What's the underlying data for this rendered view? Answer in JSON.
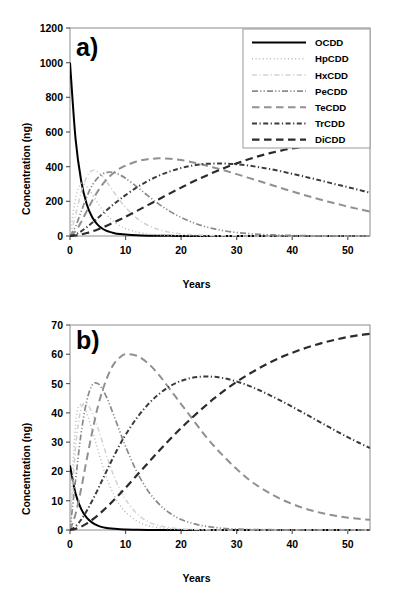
{
  "figure": {
    "panels": [
      {
        "tag": "a)",
        "xlabel": "Years",
        "ylabel": "Concentration (ng)",
        "yticks": [
          "0",
          "200",
          "400",
          "600",
          "800",
          "1000",
          "1200"
        ],
        "xticks": [
          "0",
          "10",
          "20",
          "30",
          "40",
          "50"
        ]
      },
      {
        "tag": "b)",
        "xlabel": "Years",
        "ylabel": "Concentration (ng)",
        "yticks": [
          "0",
          "10",
          "20",
          "30",
          "40",
          "50",
          "60",
          "70"
        ],
        "xticks": [
          "0",
          "10",
          "20",
          "30",
          "40",
          "50"
        ]
      }
    ],
    "legend": {
      "position": "top-right-panel-a",
      "entries": [
        {
          "label": "OCDD",
          "style": "solid",
          "color": "#000000",
          "width": 2.0
        },
        {
          "label": "HpCDD",
          "style": "dotted",
          "color": "#b9b9b9",
          "width": 1.5
        },
        {
          "label": "HxCDD",
          "style": "dash-dot",
          "color": "#d2d2d2",
          "width": 1.5
        },
        {
          "label": "PeCDD",
          "style": "dash-dot-dot",
          "color": "#8a8a8a",
          "width": 1.7
        },
        {
          "label": "TeCDD",
          "style": "long-dash",
          "color": "#909090",
          "width": 2.0
        },
        {
          "label": "TrCDD",
          "style": "dash-dot",
          "color": "#3a3a3a",
          "width": 2.0
        },
        {
          "label": "DiCDD",
          "style": "long-dash",
          "color": "#2b2b2b",
          "width": 2.2
        }
      ]
    }
  },
  "chart_data": [
    {
      "type": "line",
      "panel": "a)",
      "title": "",
      "xlabel": "Years",
      "ylabel": "Concentration (ng)",
      "xlim": [
        0,
        54
      ],
      "ylim": [
        0,
        1200
      ],
      "xticks": [
        0,
        10,
        20,
        30,
        40,
        50
      ],
      "yticks": [
        0,
        200,
        400,
        600,
        800,
        1000,
        1200
      ],
      "grid": false,
      "legend_position": "upper right",
      "x": [
        0,
        1,
        2,
        3,
        4,
        5,
        6,
        7,
        8,
        9,
        10,
        12,
        14,
        16,
        18,
        20,
        22,
        24,
        26,
        28,
        30,
        32,
        34,
        36,
        38,
        40,
        42,
        44,
        46,
        48,
        50,
        52,
        54
      ],
      "series": [
        {
          "name": "OCDD",
          "style": "solid",
          "color": "#000000",
          "peak_x": 0,
          "peak_y": 1000,
          "values": [
            1000,
            560,
            320,
            185,
            108,
            64,
            39,
            25,
            16,
            11,
            8,
            4,
            2,
            1,
            1,
            0,
            0,
            0,
            0,
            0,
            0,
            0,
            0,
            0,
            0,
            0,
            0,
            0,
            0,
            0,
            0,
            0,
            0
          ]
        },
        {
          "name": "HpCDD",
          "style": "dotted",
          "color": "#b9b9b9",
          "peak_x": 2.2,
          "peak_y": 305,
          "values": [
            0,
            215,
            302,
            287,
            240,
            190,
            145,
            108,
            80,
            59,
            43,
            23,
            12,
            6,
            3,
            2,
            1,
            0,
            0,
            0,
            0,
            0,
            0,
            0,
            0,
            0,
            0,
            0,
            0,
            0,
            0,
            0,
            0
          ]
        },
        {
          "name": "HxCDD",
          "style": "dash-dot",
          "color": "#d2d2d2",
          "peak_x": 3.8,
          "peak_y": 380,
          "values": [
            0,
            120,
            250,
            340,
            378,
            370,
            338,
            295,
            248,
            204,
            165,
            103,
            62,
            37,
            21,
            12,
            7,
            4,
            2,
            1,
            1,
            0,
            0,
            0,
            0,
            0,
            0,
            0,
            0,
            0,
            0,
            0,
            0
          ]
        },
        {
          "name": "PeCDD",
          "style": "dash-dot-dot",
          "color": "#8a8a8a",
          "peak_x": 6.5,
          "peak_y": 370,
          "values": [
            0,
            55,
            140,
            225,
            292,
            335,
            360,
            369,
            365,
            352,
            333,
            285,
            233,
            184,
            142,
            107,
            79,
            57,
            41,
            29,
            20,
            14,
            10,
            7,
            5,
            3,
            2,
            1,
            1,
            1,
            0,
            0,
            0
          ]
        },
        {
          "name": "TeCDD",
          "style": "long-dash",
          "color": "#909090",
          "peak_x": 13,
          "peak_y": 448,
          "values": [
            0,
            28,
            80,
            143,
            204,
            258,
            303,
            340,
            368,
            390,
            406,
            430,
            443,
            448,
            446,
            438,
            426,
            411,
            394,
            376,
            357,
            337,
            317,
            297,
            277,
            257,
            238,
            220,
            202,
            186,
            170,
            155,
            141
          ]
        },
        {
          "name": "TrCDD",
          "style": "dash-dot",
          "color": "#3a3a3a",
          "peak_x": 24,
          "peak_y": 418,
          "values": [
            0,
            9,
            27,
            50,
            76,
            104,
            132,
            160,
            187,
            212,
            236,
            280,
            317,
            348,
            373,
            392,
            406,
            415,
            418,
            418,
            414,
            407,
            397,
            386,
            373,
            359,
            344,
            329,
            313,
            297,
            282,
            266,
            250
          ]
        },
        {
          "name": "DiCDD",
          "style": "long-dash",
          "color": "#2b2b2b",
          "peak_x": 54,
          "peak_y": 525,
          "values": [
            0,
            3,
            9,
            17,
            27,
            38,
            51,
            65,
            80,
            95,
            111,
            144,
            178,
            212,
            246,
            279,
            311,
            341,
            369,
            395,
            419,
            441,
            461,
            478,
            493,
            505,
            514,
            519,
            522,
            524,
            525,
            524,
            522
          ]
        }
      ]
    },
    {
      "type": "line",
      "panel": "b)",
      "title": "",
      "xlabel": "Years",
      "ylabel": "Concentration (ng)",
      "xlim": [
        0,
        54
      ],
      "ylim": [
        0,
        70
      ],
      "xticks": [
        0,
        10,
        20,
        30,
        40,
        50
      ],
      "yticks": [
        0,
        10,
        20,
        30,
        40,
        50,
        60,
        70
      ],
      "grid": false,
      "legend_position": "none",
      "x": [
        0,
        1,
        2,
        3,
        4,
        5,
        6,
        7,
        8,
        9,
        10,
        12,
        14,
        16,
        18,
        20,
        22,
        24,
        26,
        28,
        30,
        32,
        34,
        36,
        38,
        40,
        42,
        44,
        46,
        48,
        50,
        52,
        54
      ],
      "series": [
        {
          "name": "OCDD",
          "style": "solid",
          "color": "#000000",
          "peak_x": 0,
          "peak_y": 22,
          "values": [
            22,
            12.5,
            7.2,
            4.2,
            2.5,
            1.5,
            0.9,
            0.6,
            0.4,
            0.25,
            0.18,
            0.08,
            0.04,
            0.02,
            0.01,
            0,
            0,
            0,
            0,
            0,
            0,
            0,
            0,
            0,
            0,
            0,
            0,
            0,
            0,
            0,
            0,
            0,
            0
          ]
        },
        {
          "name": "HpCDD",
          "style": "dotted",
          "color": "#b9b9b9",
          "peak_x": 1.6,
          "peak_y": 43,
          "values": [
            0,
            36,
            43,
            40,
            34,
            27.5,
            21,
            15.8,
            11.6,
            8.4,
            6.1,
            3.1,
            1.5,
            0.8,
            0.4,
            0.2,
            0.1,
            0,
            0,
            0,
            0,
            0,
            0,
            0,
            0,
            0,
            0,
            0,
            0,
            0,
            0,
            0,
            0
          ]
        },
        {
          "name": "HxCDD",
          "style": "dash-dot",
          "color": "#d2d2d2",
          "peak_x": 2.2,
          "peak_y": 43,
          "values": [
            0,
            28,
            41.5,
            43,
            40,
            35,
            29,
            23,
            18,
            13.8,
            10.4,
            5.6,
            2.9,
            1.5,
            0.8,
            0.4,
            0.2,
            0.1,
            0,
            0,
            0,
            0,
            0,
            0,
            0,
            0,
            0,
            0,
            0,
            0,
            0,
            0,
            0
          ]
        },
        {
          "name": "PeCDD",
          "style": "dash-dot-dot",
          "color": "#8a8a8a",
          "peak_x": 3.8,
          "peak_y": 50,
          "values": [
            0,
            17,
            33,
            44,
            49.5,
            50,
            47.5,
            43.5,
            38.5,
            33.5,
            28.5,
            20,
            13.5,
            8.9,
            5.7,
            3.6,
            2.3,
            1.4,
            0.9,
            0.5,
            0.3,
            0.2,
            0.1,
            0.1,
            0,
            0,
            0,
            0,
            0,
            0,
            0,
            0,
            0
          ]
        },
        {
          "name": "TeCDD",
          "style": "long-dash",
          "color": "#909090",
          "peak_x": 10.5,
          "peak_y": 60,
          "values": [
            0,
            5.5,
            14,
            24,
            33.5,
            42,
            48.5,
            53.5,
            57,
            59,
            60,
            59.5,
            57,
            53,
            48,
            43,
            38,
            33,
            28.5,
            24.5,
            20.8,
            17.5,
            14.8,
            12.5,
            10.5,
            8.9,
            7.5,
            6.4,
            5.5,
            4.8,
            4.2,
            3.8,
            3.5
          ]
        },
        {
          "name": "TrCDD",
          "style": "dash-dot",
          "color": "#3a3a3a",
          "peak_x": 23,
          "peak_y": 52.5,
          "values": [
            0,
            1.2,
            3.5,
            6.5,
            10,
            13.8,
            17.8,
            21.8,
            25.6,
            29.2,
            32.5,
            38.2,
            42.8,
            46.4,
            49.1,
            50.9,
            52,
            52.4,
            52.3,
            51.7,
            50.7,
            49.4,
            47.8,
            46,
            44.1,
            42.1,
            40,
            37.9,
            35.8,
            33.7,
            31.7,
            29.8,
            28
          ]
        },
        {
          "name": "DiCDD",
          "style": "long-dash",
          "color": "#2b2b2b",
          "peak_x": 54,
          "peak_y": 67,
          "values": [
            0,
            0.4,
            1.1,
            2.2,
            3.5,
            5,
            6.7,
            8.5,
            10.4,
            12.4,
            14.4,
            18.6,
            22.8,
            27,
            31,
            34.8,
            38.4,
            41.8,
            45,
            47.9,
            50.6,
            53,
            55.2,
            57.2,
            59,
            60.5,
            61.9,
            63.1,
            64.2,
            65.1,
            65.9,
            66.5,
            67
          ]
        }
      ]
    }
  ]
}
